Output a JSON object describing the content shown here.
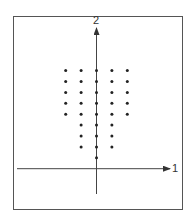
{
  "figure": {
    "axis_labels": {
      "horizontal": "1",
      "vertical": "2"
    },
    "colors": {
      "axis": "#444444",
      "dot": "#222222",
      "frame": "#555555"
    }
  },
  "chart_data": {
    "type": "scatter",
    "title": "",
    "xlabel": "1",
    "ylabel": "2",
    "grid": false,
    "points": [
      [
        -2,
        9
      ],
      [
        -1,
        9
      ],
      [
        0,
        9
      ],
      [
        1,
        9
      ],
      [
        2,
        9
      ],
      [
        -2,
        8
      ],
      [
        -1,
        8
      ],
      [
        0,
        8
      ],
      [
        1,
        8
      ],
      [
        2,
        8
      ],
      [
        -2,
        7
      ],
      [
        -1,
        7
      ],
      [
        0,
        7
      ],
      [
        1,
        7
      ],
      [
        2,
        7
      ],
      [
        -2,
        6
      ],
      [
        -1,
        6
      ],
      [
        0,
        6
      ],
      [
        1,
        6
      ],
      [
        2,
        6
      ],
      [
        -2,
        5
      ],
      [
        -1,
        5
      ],
      [
        0,
        5
      ],
      [
        1,
        5
      ],
      [
        2,
        5
      ],
      [
        -1,
        4
      ],
      [
        0,
        4
      ],
      [
        1,
        4
      ],
      [
        -1,
        3
      ],
      [
        0,
        3
      ],
      [
        1,
        3
      ],
      [
        -1,
        2
      ],
      [
        0,
        2
      ],
      [
        1,
        2
      ],
      [
        0,
        1
      ]
    ],
    "origin_px": [
      96.5,
      168.7
    ],
    "unit_px": [
      15.4,
      10.9
    ]
  }
}
